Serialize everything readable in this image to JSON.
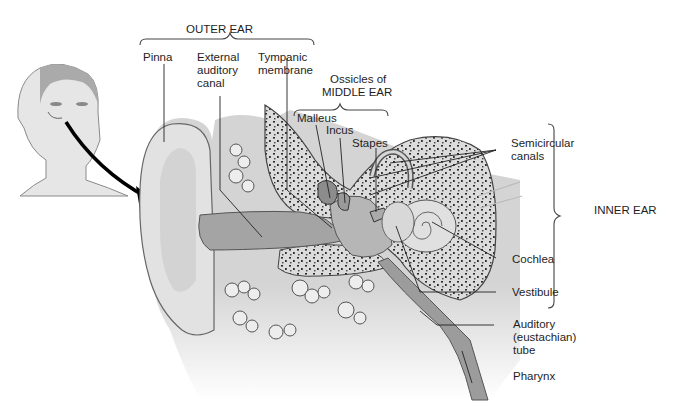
{
  "diagram": {
    "type": "anatomical-illustration",
    "colors": {
      "background": "#ffffff",
      "line": "#222222",
      "bone": "#d8d8d8",
      "tissue": "#c4c4c4",
      "canal": "#9a9a9a",
      "speckle": "#2a2a2a"
    },
    "groups": {
      "outer_ear": "OUTER EAR",
      "middle_ear_line1": "Ossicles of",
      "middle_ear_line2": "MIDDLE EAR",
      "inner_ear": "INNER EAR"
    },
    "labels": {
      "pinna": "Pinna",
      "external_canal": "External\nauditory\ncanal",
      "tympanic": "Tympanic\nmembrane",
      "malleus": "Malleus",
      "incus": "Incus",
      "stapes": "Stapes",
      "semicircular": "Semicircular\ncanals",
      "cochlea": "Cochlea",
      "vestibule": "Vestibule",
      "auditory_tube": "Auditory\n(eustachian)\ntube",
      "pharynx": "Pharynx"
    },
    "inset": "head-profile-with-arrow"
  }
}
